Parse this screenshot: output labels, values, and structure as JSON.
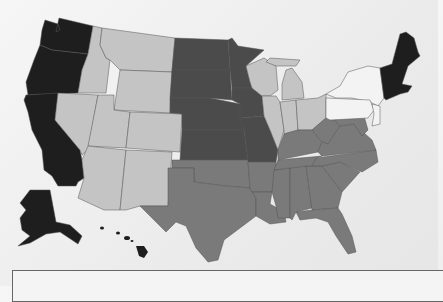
{
  "map": {
    "title_partial": "",
    "classes": [
      {
        "id": "c1",
        "color": "#1e1e1e"
      },
      {
        "id": "c2",
        "color": "#4b4b4b"
      },
      {
        "id": "c3",
        "color": "#7a7a7a"
      },
      {
        "id": "c4",
        "color": "#c4c4c4"
      },
      {
        "id": "c5",
        "color": "#f3f3f3"
      }
    ],
    "regions": {
      "c1": [
        "Washington",
        "Oregon",
        "California",
        "Alaska",
        "Hawaii",
        "Maine",
        "New Hampshire",
        "Vermont",
        "Massachusetts",
        "Connecticut",
        "Rhode Island"
      ],
      "c2": [
        "North Dakota",
        "South Dakota",
        "Nebraska",
        "Kansas",
        "Minnesota",
        "Iowa",
        "Missouri"
      ],
      "c3": [
        "Texas",
        "Oklahoma",
        "Arkansas",
        "Louisiana",
        "Mississippi",
        "Alabama",
        "Georgia",
        "Florida",
        "South Carolina",
        "North Carolina",
        "Tennessee",
        "Kentucky",
        "Virginia",
        "West Virginia",
        "Maryland",
        "Delaware"
      ],
      "c4": [
        "Idaho",
        "Montana",
        "Wyoming",
        "Nevada",
        "Utah",
        "Colorado",
        "Arizona",
        "New Mexico",
        "Wisconsin",
        "Michigan",
        "Illinois",
        "Indiana",
        "Ohio"
      ],
      "c5": [
        "New York",
        "Pennsylvania",
        "New Jersey"
      ]
    }
  }
}
